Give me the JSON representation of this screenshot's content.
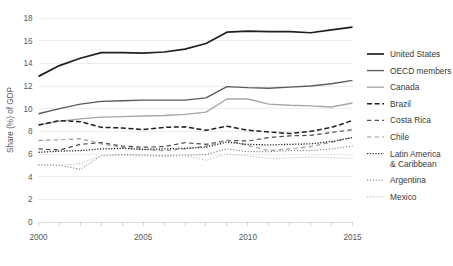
{
  "chart_data": {
    "type": "line",
    "title": "",
    "xlabel": "",
    "ylabel": "Share (%) of GDP",
    "xlim": [
      2000,
      2015
    ],
    "ylim": [
      0,
      18
    ],
    "ytick_step": 2,
    "yticks": [
      "0",
      "2",
      "4",
      "6",
      "8",
      "10",
      "12",
      "14",
      "16",
      "18"
    ],
    "xticks": [
      "2000",
      "2005",
      "2010",
      "2015"
    ],
    "xtick_values": [
      2000,
      2005,
      2010,
      2015
    ],
    "x": [
      2000,
      2001,
      2002,
      2003,
      2004,
      2005,
      2006,
      2007,
      2008,
      2009,
      2010,
      2011,
      2012,
      2013,
      2014,
      2015
    ],
    "grid": true,
    "grid_axis": "y",
    "legend_position": "right",
    "series": [
      {
        "name": "United States",
        "style": "solid",
        "color": "#231f20",
        "width": 1.7,
        "values": [
          12.85,
          13.8,
          14.45,
          14.95,
          14.95,
          14.9,
          15.0,
          15.25,
          15.75,
          16.75,
          16.85,
          16.8,
          16.8,
          16.7,
          16.95,
          17.2
        ]
      },
      {
        "name": "OECD members",
        "style": "solid",
        "color": "#5b5b5d",
        "width": 1.35,
        "values": [
          9.55,
          10.0,
          10.4,
          10.65,
          10.7,
          10.75,
          10.75,
          10.75,
          10.95,
          11.95,
          11.85,
          11.8,
          11.9,
          12.0,
          12.2,
          12.5
        ]
      },
      {
        "name": "Canada",
        "style": "solid",
        "color": "#a6a6a8",
        "width": 1.35,
        "values": [
          8.55,
          8.9,
          9.1,
          9.25,
          9.3,
          9.35,
          9.4,
          9.5,
          9.7,
          10.85,
          10.85,
          10.4,
          10.3,
          10.25,
          10.15,
          10.5
        ]
      },
      {
        "name": "Brazil",
        "style": "dashed",
        "color": "#231f20",
        "width": 1.5,
        "dash": "5,2.6",
        "values": [
          8.55,
          8.95,
          8.85,
          8.35,
          8.3,
          8.15,
          8.35,
          8.4,
          8.1,
          8.45,
          8.1,
          7.95,
          7.8,
          8.0,
          8.35,
          8.95
        ]
      },
      {
        "name": "Costa Rica",
        "style": "dashed",
        "color": "#4d4d4f",
        "width": 1.2,
        "dash": "4.4,3.2",
        "values": [
          6.45,
          6.35,
          6.85,
          7.0,
          6.7,
          6.6,
          6.65,
          7.0,
          6.85,
          7.2,
          7.15,
          7.45,
          7.6,
          7.65,
          7.9,
          8.15
        ]
      },
      {
        "name": "Chile",
        "style": "dashed",
        "color": "#9b9b9d",
        "width": 1.2,
        "dash": "4.4,3.2",
        "values": [
          7.2,
          7.25,
          7.35,
          6.9,
          6.6,
          6.4,
          6.3,
          6.45,
          6.7,
          7.2,
          6.75,
          6.3,
          6.45,
          6.65,
          7.05,
          7.45
        ]
      },
      {
        "name": "Latin America & Caribbean",
        "style": "dotted",
        "color": "#231f20",
        "width": 1.3,
        "dash": "1.2,1.6",
        "values": [
          6.15,
          6.25,
          6.3,
          6.45,
          6.5,
          6.4,
          6.45,
          6.5,
          6.6,
          7.05,
          6.85,
          6.8,
          6.85,
          6.9,
          7.1,
          7.45
        ]
      },
      {
        "name": "Argentina",
        "style": "dotted",
        "color": "#6d6d6f",
        "width": 1.0,
        "dash": "1.1,1.8",
        "values": [
          5.05,
          5.0,
          4.65,
          5.85,
          5.95,
          5.9,
          5.85,
          5.9,
          5.95,
          6.45,
          6.2,
          6.2,
          6.3,
          6.3,
          6.45,
          6.7
        ]
      },
      {
        "name": "Mexico",
        "style": "dotted",
        "color": "#b5b5b7",
        "width": 1.0,
        "dash": "1.1,1.8",
        "values": [
          5.05,
          5.0,
          5.15,
          5.85,
          5.9,
          5.85,
          5.8,
          5.85,
          5.45,
          6.0,
          5.85,
          5.6,
          5.65,
          5.75,
          5.65,
          5.6
        ]
      }
    ]
  },
  "legend": {
    "entries": [
      {
        "label": "United States"
      },
      {
        "label": "OECD members"
      },
      {
        "label": "Canada"
      },
      {
        "label": "Brazil"
      },
      {
        "label": "Costa Rica"
      },
      {
        "label": "Chile"
      },
      {
        "label": "Latin America",
        "label2": "& Caribbean"
      },
      {
        "label": "Argentina"
      },
      {
        "label": "Mexico"
      }
    ]
  }
}
